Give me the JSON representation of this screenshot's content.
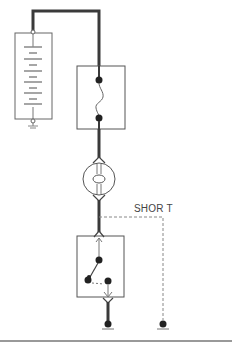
{
  "diagram": {
    "labels": {
      "short": "SHOR T"
    },
    "components": [
      {
        "name": "battery",
        "type": "battery-stack"
      },
      {
        "name": "fuse",
        "type": "fuse"
      },
      {
        "name": "bulb",
        "type": "lamp"
      },
      {
        "name": "switch",
        "type": "switch"
      },
      {
        "name": "ground-main",
        "type": "ground"
      },
      {
        "name": "ground-short",
        "type": "ground"
      }
    ],
    "colors": {
      "wire": "#3a3a3a",
      "box": "#555555",
      "dashed": "#888888",
      "baseline": "#777777"
    }
  }
}
